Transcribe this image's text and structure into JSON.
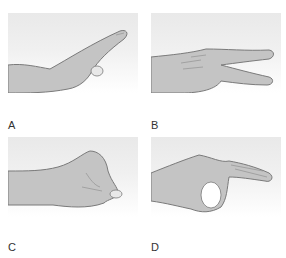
{
  "figure": {
    "panels": [
      {
        "id": "A",
        "label": "A",
        "description": "Flat hand with index finger extended, thumb tucked"
      },
      {
        "id": "B",
        "label": "B",
        "description": "Hand with index and middle fingers extended apart (V sign, horizontal)"
      },
      {
        "id": "C",
        "label": "C",
        "description": "Closed fist"
      },
      {
        "id": "D",
        "label": "D",
        "description": "Thumb and index finger forming a circle (OK sign), other fingers extended"
      }
    ],
    "colors": {
      "skin": "#c4c4c4",
      "outline": "#7a7a7a",
      "background_gradient_top": "#e9e9e9"
    }
  }
}
